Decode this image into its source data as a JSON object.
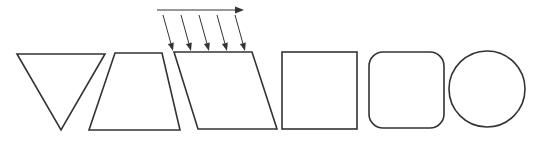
{
  "diagram": {
    "stroke_color": "#333333",
    "background": "#ffffff",
    "shapes": [
      {
        "id": "triangle",
        "kind": "inverted-triangle"
      },
      {
        "id": "trapezoid",
        "kind": "trapezoid"
      },
      {
        "id": "parallelogram",
        "kind": "parallelogram",
        "annotated_with_shear_arrows": true
      },
      {
        "id": "square",
        "kind": "square"
      },
      {
        "id": "rounded-square",
        "kind": "rounded-square"
      },
      {
        "id": "circle",
        "kind": "circle"
      }
    ],
    "shear_arrows": {
      "horizontal_arrow_count": 1,
      "slanted_arrow_count": 5,
      "direction": "right"
    }
  }
}
